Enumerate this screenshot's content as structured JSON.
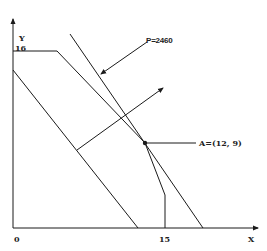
{
  "axes": {
    "x_label": "X",
    "y_label": "Y",
    "origin_label": "0",
    "x_tick_label": "15",
    "y_tick_label": "16"
  },
  "annotations": {
    "objective_line_label": "P=2460",
    "optimal_point_label": "A=(12, 9)"
  },
  "colors": {
    "line": "#1a1a1a",
    "background": "#ffffff"
  }
}
